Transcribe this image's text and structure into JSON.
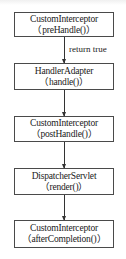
{
  "diagram": {
    "type": "flowchart",
    "direction": "top-to-bottom",
    "colors": {
      "border": "#4a4a4a",
      "arrow": "#333333",
      "text": "#1a1a1a",
      "background": "#ffffff"
    },
    "nodes": [
      {
        "id": "n1",
        "title": "CustomInterceptor",
        "subtitle": "（preHandle()）"
      },
      {
        "id": "n2",
        "title": "HandlerAdapter",
        "subtitle": "（handle()）"
      },
      {
        "id": "n3",
        "title": "CustomInterceptor",
        "subtitle": "（postHandle()）"
      },
      {
        "id": "n4",
        "title": "DispatcherServlet",
        "subtitle": "（render()）"
      },
      {
        "id": "n5",
        "title": "CustomInterceptor",
        "subtitle": "（afterCompletion()）"
      }
    ],
    "edges": [
      {
        "from": "n1",
        "to": "n2",
        "label": "return true"
      },
      {
        "from": "n2",
        "to": "n3",
        "label": ""
      },
      {
        "from": "n3",
        "to": "n4",
        "label": ""
      },
      {
        "from": "n4",
        "to": "n5",
        "label": ""
      }
    ]
  }
}
